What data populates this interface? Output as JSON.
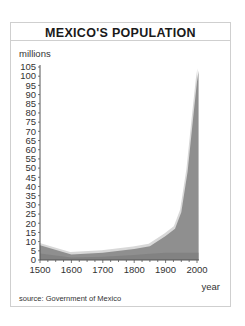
{
  "chart_data": {
    "type": "area",
    "title": "MEXICO'S POPULATION",
    "xlabel": "year",
    "ylabel": "millions",
    "source": "source: Government of Mexico",
    "x": [
      1500,
      1600,
      1700,
      1800,
      1850,
      1900,
      1930,
      1950,
      1970,
      1990,
      2000,
      2005
    ],
    "series": [
      {
        "name": "population (millions)",
        "values": [
          8,
          3,
          4,
          6,
          7.5,
          13,
          17,
          26,
          48,
          81,
          97,
          103
        ]
      }
    ],
    "xlim": [
      1500,
      2005
    ],
    "ylim": [
      0,
      105
    ],
    "xticks": [
      1500,
      1600,
      1700,
      1800,
      1900,
      2000
    ],
    "yticks": [
      0,
      5,
      10,
      15,
      20,
      25,
      30,
      35,
      40,
      45,
      50,
      55,
      60,
      65,
      70,
      75,
      80,
      85,
      90,
      95,
      100,
      105
    ],
    "grid": false,
    "legend": "none",
    "colors": {
      "fill": "#8f8f8f",
      "highlight": "#d8d8d8",
      "axis": "#555555"
    }
  }
}
